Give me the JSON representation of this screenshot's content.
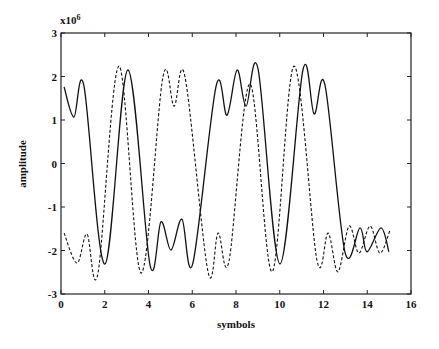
{
  "chart_data": {
    "type": "line",
    "title": "",
    "xlabel": "symbols",
    "ylabel": "amplitude",
    "y_scale_label": "x10^6",
    "y_scale_base": "x10",
    "y_scale_exp": "6",
    "xlim": [
      0,
      16
    ],
    "ylim": [
      -3,
      3
    ],
    "xticks": [
      0,
      2,
      4,
      6,
      8,
      10,
      12,
      14,
      16
    ],
    "yticks": [
      -3,
      -2,
      -1,
      0,
      1,
      2,
      3
    ],
    "grid": false,
    "legend": null,
    "series": [
      {
        "name": "solid",
        "style": "solid",
        "x": [
          0.14,
          0.59,
          1.05,
          2.01,
          3.06,
          4.07,
          4.57,
          5.03,
          5.53,
          6.03,
          7.09,
          7.59,
          8.05,
          8.46,
          9.01,
          10.01,
          11.06,
          11.57,
          12.07,
          12.98,
          13.67,
          13.99,
          14.63,
          14.99
        ],
        "y": [
          1.76,
          1.07,
          1.78,
          -2.31,
          2.15,
          -2.33,
          -1.34,
          -1.99,
          -1.28,
          -2.29,
          1.78,
          1.11,
          2.15,
          1.32,
          2.17,
          -2.31,
          2.15,
          1.14,
          1.8,
          -2.03,
          -1.48,
          -2.03,
          -1.48,
          -2.03
        ]
      },
      {
        "name": "dashed",
        "style": "dashed",
        "x": [
          0.14,
          0.73,
          1.19,
          1.69,
          2.65,
          3.66,
          4.66,
          5.17,
          5.67,
          6.72,
          7.18,
          7.68,
          8.64,
          9.65,
          10.65,
          11.7,
          12.21,
          12.66,
          13.17,
          13.62,
          14.13,
          14.58,
          15.04
        ],
        "y": [
          -1.6,
          -2.29,
          -1.62,
          -2.52,
          2.24,
          -2.52,
          1.99,
          1.32,
          1.99,
          -2.49,
          -1.6,
          -2.24,
          1.83,
          -2.49,
          2.24,
          -2.22,
          -1.6,
          -2.49,
          -1.44,
          -2.06,
          -1.44,
          -2.06,
          -1.53
        ]
      }
    ]
  }
}
